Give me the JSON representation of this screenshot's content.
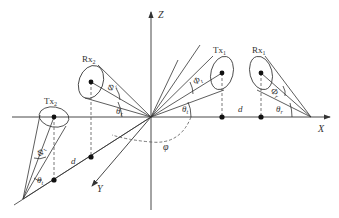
{
  "diagram": {
    "axes": {
      "x_label": "X",
      "y_label": "Y",
      "z_label": "Z"
    },
    "nodes": {
      "tx1": {
        "label": "Tx",
        "subscript": "1"
      },
      "rx1": {
        "label": "Rx",
        "subscript": "1"
      },
      "tx2": {
        "label": "Tx",
        "subscript": "2"
      },
      "rx2": {
        "label": "Rx",
        "subscript": "2"
      }
    },
    "angles": {
      "phi_t": {
        "symbol": "Φ",
        "subscript": "t"
      },
      "phi_r": {
        "symbol": "Φ",
        "subscript": "r"
      },
      "theta_t": {
        "symbol": "θ",
        "subscript": "t"
      },
      "theta_r": {
        "symbol": "θ",
        "subscript": "r"
      },
      "phi": {
        "symbol": "φ"
      }
    },
    "distances": {
      "d_x": "d",
      "d_y": "d"
    },
    "colors": {
      "line": "#333333",
      "dashed": "#555555",
      "dot": "#111111"
    }
  }
}
